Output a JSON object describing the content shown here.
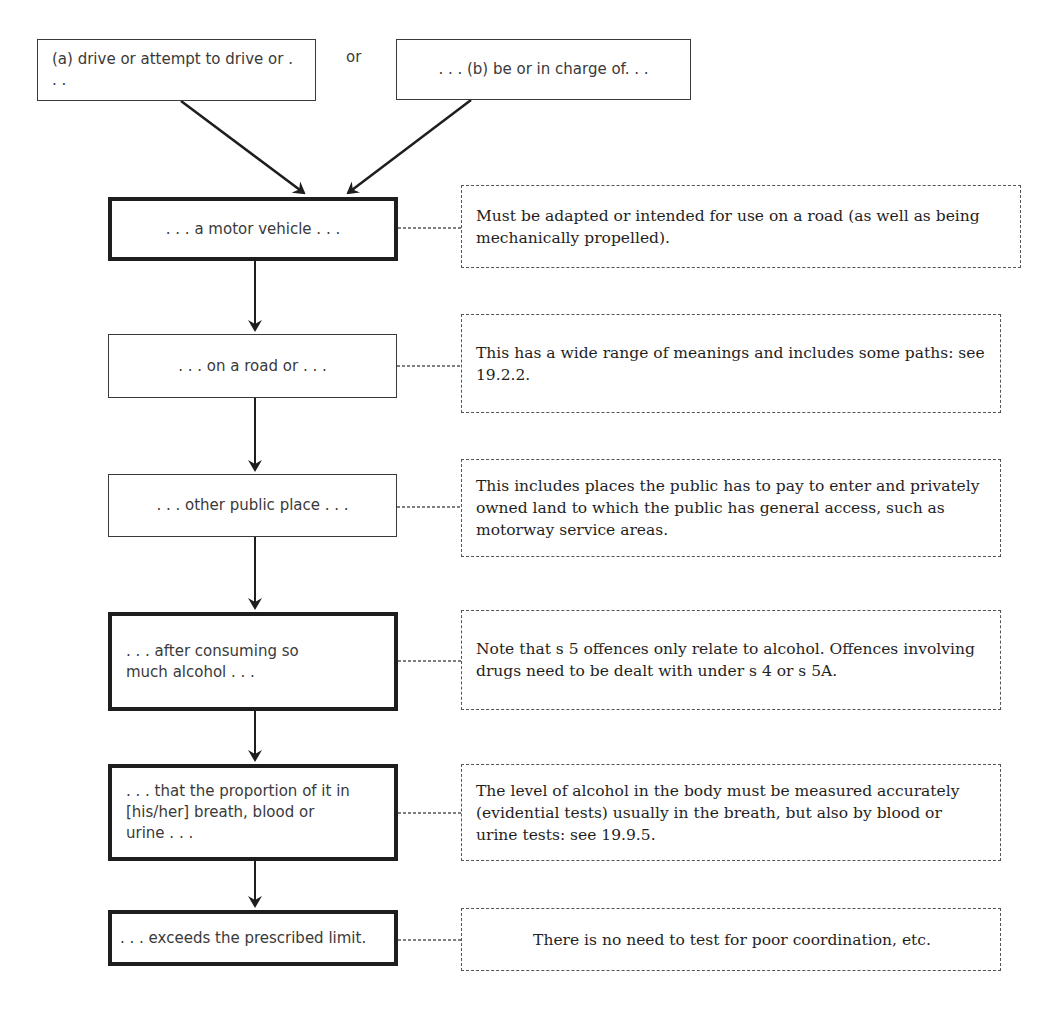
{
  "diagram": {
    "type": "flowchart",
    "top_boxes": [
      {
        "id": "a",
        "label": "(a) drive or attempt to drive or . . ."
      },
      {
        "id": "b",
        "label": ". . . (b) be or in charge of. . ."
      }
    ],
    "connector_label": "or",
    "steps": [
      {
        "label": ". . . a motor vehicle . . .",
        "emphasis": "thick",
        "note": "Must be adapted or intended for use on a road (as well as being mechanically propelled)."
      },
      {
        "label": ". . . on a road or . . .",
        "emphasis": "thin",
        "note": "This has a wide range of meanings and includes some paths: see 19.2.2."
      },
      {
        "label": ". . . other public place . . .",
        "emphasis": "thin",
        "note": "This includes places the public has to pay to enter and privately owned land to which the public has general access, such as motorway service areas."
      },
      {
        "label": ". . . after consuming so much alcohol . . .",
        "emphasis": "thick",
        "note": "Note that s 5 offences only relate to alcohol. Offences involving drugs need to be dealt with under s 4 or s 5A."
      },
      {
        "label": ". . . that the proportion of it in [his/her] breath, blood or urine . . .",
        "emphasis": "thick",
        "note": "The level of alcohol in the body must be measured accurately (evidential tests) usually in the breath, but also by blood or urine tests: see 19.9.5."
      },
      {
        "label": ". . . exceeds the prescribed limit.",
        "emphasis": "thick",
        "note": "There is no need to test for poor coordination, etc."
      }
    ],
    "colors": {
      "box_border": "#1e1e1e",
      "text": "#3a3a3a",
      "note_border": "#555555",
      "background": "#ffffff"
    }
  }
}
